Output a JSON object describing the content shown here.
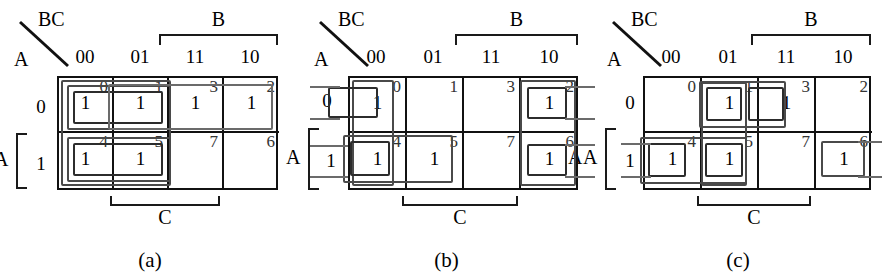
{
  "figure": {
    "maps": [
      {
        "id": "a",
        "caption": "(a)",
        "corner_top_label": "BC",
        "corner_bottom_label": "A",
        "column_headers": [
          "00",
          "01",
          "11",
          "10"
        ],
        "row_headers": [
          "0",
          "1"
        ],
        "top_bracket_label": "B",
        "bottom_bracket_label": "C",
        "row_bracket_label": "A",
        "cells": [
          {
            "index": "0",
            "value": "1"
          },
          {
            "index": "1",
            "value": "1"
          },
          {
            "index": "3",
            "value": "1"
          },
          {
            "index": "2",
            "value": "1"
          },
          {
            "index": "4",
            "value": "1"
          },
          {
            "index": "5",
            "value": "1"
          },
          {
            "index": "7",
            "value": ""
          },
          {
            "index": "6",
            "value": ""
          }
        ],
        "groups": [
          {
            "name": "group-outer-00-01-both-rows",
            "cells": [
              "0",
              "1",
              "4",
              "5"
            ]
          },
          {
            "name": "group-row0-00-01",
            "cells": [
              "0",
              "1"
            ]
          },
          {
            "name": "group-row1-00-01",
            "cells": [
              "4",
              "5"
            ]
          },
          {
            "name": "group-row0-01-11-10",
            "cells": [
              "1",
              "3",
              "2"
            ]
          }
        ]
      },
      {
        "id": "b",
        "caption": "(b)",
        "corner_top_label": "BC",
        "corner_bottom_label": "A",
        "column_headers": [
          "00",
          "01",
          "11",
          "10"
        ],
        "row_headers": [
          "0",
          "1"
        ],
        "top_bracket_label": "B",
        "bottom_bracket_label": "C",
        "row_bracket_label": "A",
        "right_label": "A",
        "cells": [
          {
            "index": "0",
            "value": "1"
          },
          {
            "index": "1",
            "value": ""
          },
          {
            "index": "3",
            "value": ""
          },
          {
            "index": "2",
            "value": "1"
          },
          {
            "index": "4",
            "value": "1"
          },
          {
            "index": "5",
            "value": "1"
          },
          {
            "index": "7",
            "value": ""
          },
          {
            "index": "6",
            "value": "1"
          }
        ],
        "groups": [
          {
            "name": "group-col00-wrap-row0",
            "cells": [
              "0"
            ]
          },
          {
            "name": "group-col00-0-4",
            "cells": [
              "0",
              "4"
            ]
          },
          {
            "name": "group-row1-00-01",
            "cells": [
              "4",
              "5"
            ]
          },
          {
            "name": "group-col10-2-6",
            "cells": [
              "2",
              "6"
            ]
          },
          {
            "name": "group-wrap-row1-00-10",
            "cells": [
              "4",
              "6"
            ]
          }
        ]
      },
      {
        "id": "c",
        "caption": "(c)",
        "corner_top_label": "BC",
        "corner_bottom_label": "A",
        "column_headers": [
          "00",
          "01",
          "11",
          "10"
        ],
        "row_headers": [
          "0",
          "1"
        ],
        "top_bracket_label": "B",
        "bottom_bracket_label": "C",
        "row_bracket_label": "A",
        "cells": [
          {
            "index": "0",
            "value": ""
          },
          {
            "index": "1",
            "value": "1"
          },
          {
            "index": "3",
            "value": "1"
          },
          {
            "index": "2",
            "value": ""
          },
          {
            "index": "4",
            "value": "1"
          },
          {
            "index": "5",
            "value": "1"
          },
          {
            "index": "7",
            "value": ""
          },
          {
            "index": "6",
            "value": "1"
          }
        ],
        "groups": [
          {
            "name": "group-row0-01-11",
            "cells": [
              "1",
              "3"
            ]
          },
          {
            "name": "group-col01-1-5",
            "cells": [
              "1",
              "5"
            ]
          },
          {
            "name": "group-row1-00-01",
            "cells": [
              "4",
              "5"
            ]
          },
          {
            "name": "group-cell-6",
            "cells": [
              "6"
            ]
          },
          {
            "name": "group-wrap-row1-00-10",
            "cells": [
              "4",
              "6"
            ]
          }
        ]
      }
    ]
  },
  "colors": {
    "grid_line": "#111111",
    "group_loop": "#6b6b6b",
    "text": "#000000",
    "background": "#ffffff"
  }
}
